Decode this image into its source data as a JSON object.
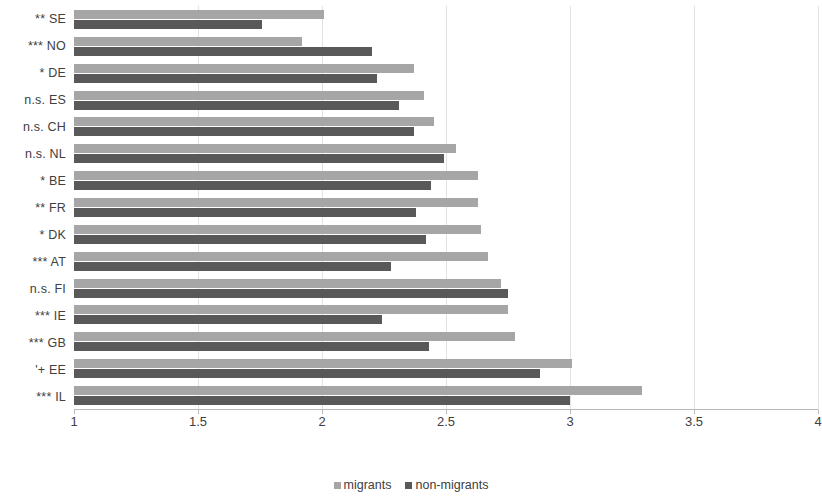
{
  "chart_data": {
    "type": "bar",
    "orientation": "horizontal",
    "title": "",
    "xlabel": "",
    "ylabel": "",
    "xlim": [
      1,
      4
    ],
    "xticks": [
      1,
      1.5,
      2,
      2.5,
      3,
      3.5,
      4
    ],
    "xtick_labels": [
      "1",
      "1.5",
      "2",
      "2.5",
      "3",
      "3.5",
      "4"
    ],
    "grid": true,
    "legend_position": "bottom",
    "categories": [
      "** SE",
      "*** NO",
      "* DE",
      "n.s. ES",
      "n.s. CH",
      "n.s. NL",
      "* BE",
      "** FR",
      "* DK",
      "*** AT",
      "n.s. FI",
      "*** IE",
      "*** GB",
      "'+ EE",
      "*** IL"
    ],
    "series": [
      {
        "name": "migrants",
        "color": "#a6a6a6",
        "values": [
          2.01,
          1.92,
          2.37,
          2.41,
          2.45,
          2.54,
          2.63,
          2.63,
          2.64,
          2.67,
          2.72,
          2.75,
          2.78,
          3.01,
          3.29
        ]
      },
      {
        "name": "non-migrants",
        "color": "#595959",
        "values": [
          1.76,
          2.2,
          2.22,
          2.31,
          2.37,
          2.49,
          2.44,
          2.38,
          2.42,
          2.28,
          2.75,
          2.24,
          2.43,
          2.88,
          3.0
        ]
      }
    ],
    "legend": [
      "migrants",
      "non-migrants"
    ]
  },
  "legend": {
    "migrants_label": "migrants",
    "nonmigrants_label": "non-migrants"
  },
  "colors": {
    "migrants": "#a6a6a6",
    "nonmigrants": "#595959",
    "gridline": "#e2e2e2",
    "axis": "#b9b9b9",
    "text": "#404040"
  }
}
